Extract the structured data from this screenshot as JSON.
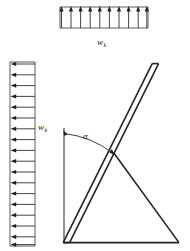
{
  "figure": {
    "background_color": "#ffffff",
    "line_color": "#242424",
    "width": 190,
    "height": 251
  },
  "top_load": {
    "name": "top-distributed-load",
    "label_symbol": "w",
    "label_subscript": "k",
    "direction": "up",
    "arrow_count": 10,
    "box": {
      "x": 60,
      "y": 6,
      "width": 88,
      "height": 22
    },
    "label_position": {
      "x": 101,
      "y": 42
    }
  },
  "left_load": {
    "name": "left-distributed-load",
    "label_symbol": "w",
    "label_subscript": "k",
    "direction": "left",
    "arrow_count": 17,
    "box": {
      "x": 10,
      "y": 62,
      "width": 25,
      "height": 184
    },
    "label_position": {
      "x": 40,
      "y": 130
    }
  },
  "angle": {
    "name": "inclination-angle",
    "symbol": "α",
    "label_position": {
      "x": 85,
      "y": 137
    }
  },
  "geometry": {
    "vertical_reference": {
      "x": 64,
      "y_top": 128,
      "y_bottom": 242
    },
    "base": {
      "x1": 64,
      "y1": 242,
      "x2": 179,
      "y2": 242
    },
    "inclined_member": {
      "x_bottom": 66,
      "y_bottom": 242,
      "x_top": 155,
      "y_top": 63,
      "thickness": 6
    },
    "strut": {
      "x1": 114,
      "y1": 152,
      "x2": 179,
      "y2": 242
    }
  }
}
